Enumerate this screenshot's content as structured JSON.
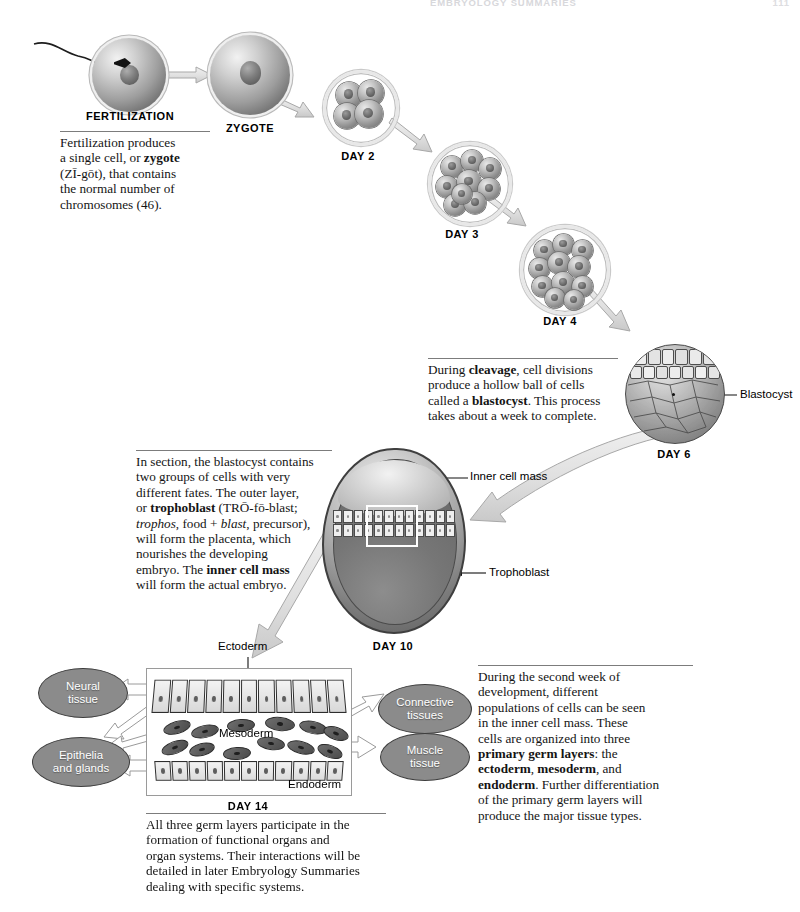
{
  "header": {
    "running_head": "EMBRYOLOGY SUMMARIES",
    "page_number": "111"
  },
  "stages": [
    {
      "id": "fertilization",
      "label": "FERTILIZATION"
    },
    {
      "id": "zygote",
      "label": "ZYGOTE"
    },
    {
      "id": "day2",
      "label": "DAY 2"
    },
    {
      "id": "day3",
      "label": "DAY 3"
    },
    {
      "id": "day4",
      "label": "DAY 4"
    },
    {
      "id": "day6",
      "label": "DAY 6"
    },
    {
      "id": "day10",
      "label": "DAY 10"
    },
    {
      "id": "day14",
      "label": "DAY 14"
    }
  ],
  "captions": {
    "fertilization": {
      "l1": "Fertilization produces",
      "l2a": "a single cell, or ",
      "l2b": "zygote",
      "l3": "(ZĪ-gōt), that contains",
      "l4": "the normal number of",
      "l5": "chromosomes (46)."
    },
    "cleavage": {
      "l1a": "During ",
      "l1b": "cleavage",
      "l1c": ", cell divisions",
      "l2": "produce a hollow ball of cells",
      "l3a": "called a ",
      "l3b": "blastocyst",
      "l3c": ". This process",
      "l4": "takes about a week to complete."
    },
    "section": {
      "l1": "In section, the blastocyst contains",
      "l2": "two groups of cells with very",
      "l3": "different fates. The outer layer,",
      "l4a": "or ",
      "l4b": "trophoblast",
      "l4c": " (TRŌ-fō-blast;",
      "l5a": "trophos",
      "l5b": ", food + ",
      "l5c": "blast",
      "l5d": ", precursor),",
      "l6": "will form the placenta, which",
      "l7": "nourishes the developing",
      "l8a": "embryo. The ",
      "l8b": "inner cell mass",
      "l9": "will form the actual embryo."
    },
    "second_week": {
      "l1": "During the second week of",
      "l2": "development, different",
      "l3": "populations of cells can be seen",
      "l4": "in the inner cell mass. These",
      "l5": "cells are organized into three",
      "l6a": "primary germ layers",
      "l6b": ": the",
      "l7a": "ectoderm",
      "l7b": ", ",
      "l7c": "mesoderm",
      "l7d": ", and",
      "l8a": "endoderm",
      "l8b": ". Further differentiation",
      "l9": "of the primary germ layers will",
      "l10": "produce the major tissue types."
    },
    "germ_layers": {
      "l1": "All three germ layers participate in the",
      "l2": "formation of functional organs and",
      "l3": "organ systems. Their interactions will be",
      "l4": "detailed in later Embryology Summaries",
      "l5": "dealing with specific systems."
    }
  },
  "labels": {
    "blastocyst": "Blastocyst",
    "inner_cell_mass": "Inner cell mass",
    "trophoblast": "Trophoblast",
    "ectoderm": "Ectoderm",
    "mesoderm": "Mesoderm",
    "endoderm": "Endoderm"
  },
  "tissue_outcomes": [
    {
      "id": "neural",
      "line1": "Neural",
      "line2": "tissue"
    },
    {
      "id": "epithelia",
      "line1": "Epithelia",
      "line2": "and glands"
    },
    {
      "id": "connective",
      "line1": "Connective",
      "line2": "tissues"
    },
    {
      "id": "muscle",
      "line1": "Muscle",
      "line2": "tissue"
    }
  ],
  "colors": {
    "ink": "#141414",
    "rule": "#7c7c7c",
    "oval_fill": "#8b8b8b",
    "oval_text": "#ffffff",
    "arrow_fill": "#e4e4e4",
    "arrow_stroke": "#a8a8a8"
  }
}
